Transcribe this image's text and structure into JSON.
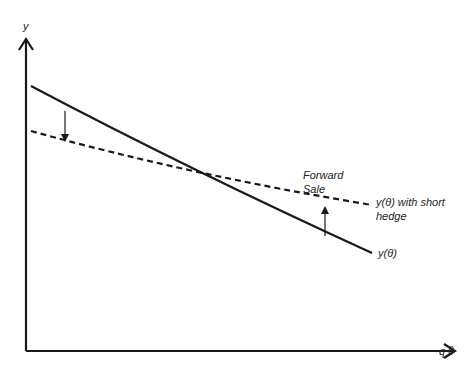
{
  "diagram": {
    "axes": {
      "y_label": "y",
      "x_label": "q θ"
    },
    "curves": [
      {
        "name": "unhedged",
        "label": "y(θ)",
        "style": "solid"
      },
      {
        "name": "hedged",
        "label_line1": "y(θ) with short",
        "label_line2": "hedge",
        "style": "dashed"
      }
    ],
    "annotation": {
      "line1": "Forward",
      "line2": "Sale"
    },
    "colors": {
      "line": "#1a1a1a",
      "text": "#222222",
      "background": "#ffffff"
    }
  }
}
